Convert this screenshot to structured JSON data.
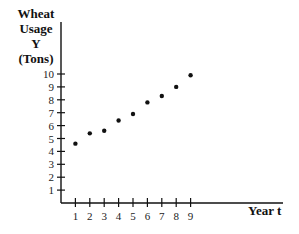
{
  "chart_data": {
    "type": "scatter",
    "title": "",
    "ylabel_lines": [
      "Wheat",
      "Usage",
      "Y",
      "(Tons)"
    ],
    "ylabel": "Wheat Usage Y (Tons)",
    "xlabel": "Year t",
    "x": [
      1,
      2,
      3,
      4,
      5,
      6,
      7,
      8,
      9
    ],
    "values": [
      4.6,
      5.4,
      5.6,
      6.4,
      6.9,
      7.8,
      8.3,
      9.0,
      9.9
    ],
    "x_ticks": [
      "1",
      "2",
      "3",
      "4",
      "5",
      "6",
      "7",
      "8",
      "9"
    ],
    "y_ticks": [
      "1",
      "2",
      "3",
      "4",
      "5",
      "6",
      "7",
      "8",
      "9",
      "10"
    ],
    "xlim": [
      0,
      15
    ],
    "ylim": [
      0,
      11
    ],
    "grid": false,
    "legend": null
  },
  "labels": {
    "y1": "Wheat",
    "y2": "Usage",
    "y3": "Y",
    "y4": "(Tons)",
    "x": "Year t"
  }
}
